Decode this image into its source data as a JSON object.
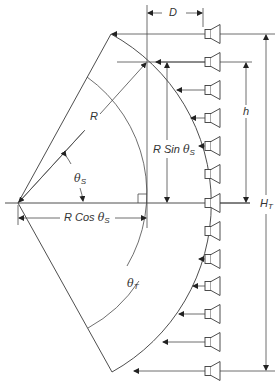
{
  "diagram": {
    "type": "line-array-geometry",
    "labels": {
      "D": "D",
      "R": "R",
      "r_sin_prefix": "R Sin ",
      "r_cos_prefix": "R Cos ",
      "theta": "θ",
      "sub_S": "S",
      "sub_T": "T",
      "h": "h",
      "H": "H",
      "sub_HT": "T"
    },
    "geometry": {
      "center": [
        18,
        203
      ],
      "outer_radius": 193,
      "inner_arc_radius": 143,
      "theta_s_arc_radius": 66,
      "top_apex": [
        111,
        34
      ],
      "bottom_apex": [
        112,
        372
      ],
      "right_angle_corner": [
        147,
        203
      ]
    },
    "speakers": {
      "count": 13,
      "x": 205,
      "y_positions": [
        34,
        62,
        90,
        118,
        146,
        174,
        203,
        231,
        259,
        286,
        314,
        342,
        371
      ],
      "arrow_tips_x": [
        111,
        147,
        176,
        191,
        198,
        203,
        208,
        205,
        199,
        193,
        180,
        163,
        137
      ]
    },
    "dimensions": [
      {
        "name": "D",
        "from": "arc top-speaker point",
        "to": "speaker face"
      },
      {
        "name": "R Sin θS",
        "span": "center line to speaker 2"
      },
      {
        "name": "R Cos θS",
        "span": "center to right angle"
      },
      {
        "name": "h",
        "span": "speaker 2 to center speaker"
      },
      {
        "name": "HT",
        "span": "top speaker to bottom speaker"
      }
    ],
    "colors": {
      "line": "#3a3a3a",
      "background": "#ffffff"
    }
  }
}
